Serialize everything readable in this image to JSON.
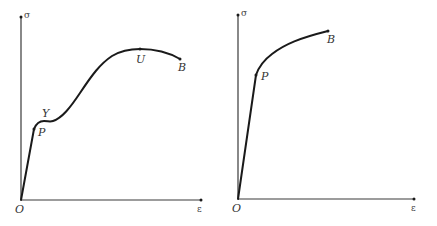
{
  "figures": [
    {
      "id": "left",
      "description": "Stress-strain curve with yield plateau (ductile material)",
      "axes": {
        "y_label": "σ",
        "x_label": "ε",
        "origin_label": "O"
      },
      "points": [
        {
          "label": "P",
          "name": "proportional-limit"
        },
        {
          "label": "Y",
          "name": "yield-point"
        },
        {
          "label": "U",
          "name": "ultimate-strength"
        },
        {
          "label": "B",
          "name": "breaking-point"
        }
      ]
    },
    {
      "id": "right",
      "description": "Stress-strain curve without distinct yield point",
      "axes": {
        "y_label": "σ",
        "x_label": "ε",
        "origin_label": "O"
      },
      "points": [
        {
          "label": "P",
          "name": "proportional-limit"
        },
        {
          "label": "B",
          "name": "breaking-point"
        }
      ]
    }
  ],
  "colors": {
    "curve": "#1a1a1a",
    "axis": "#3a3a3a",
    "background": "#ffffff"
  }
}
